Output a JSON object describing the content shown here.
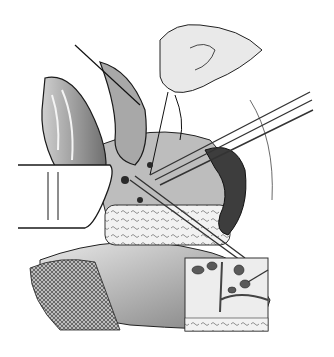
{
  "image": {
    "kind": "surgical-illustration",
    "style": "grayscale pen-and-ink",
    "subjects": [
      "gloved-hand-with-suture",
      "retracted-organ-flaps",
      "forceps",
      "scissors",
      "retractor-blade",
      "kidney",
      "pancreas-textured-tissue",
      "gauze-pad",
      "inset-detail-box"
    ],
    "colors": {
      "background": "#ffffff",
      "ink": "#1a1a1a",
      "mid": "#8a8a8a",
      "light": "#d4d4d4",
      "dark": "#3a3a3a"
    },
    "inset": {
      "x": 185,
      "y": 258,
      "width": 83,
      "height": 73
    }
  }
}
